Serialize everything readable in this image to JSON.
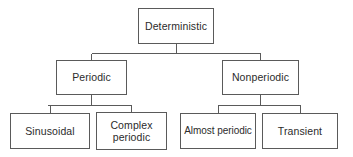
{
  "diagram": {
    "type": "tree",
    "style": {
      "background": "#ffffff",
      "border_color": "#5a5a5a",
      "text_color": "#2b2b2b",
      "node_fill": "#ffffff"
    },
    "nodes": [
      {
        "id": "deterministic",
        "label": "Deterministic",
        "level": 0,
        "x": 138,
        "y": 8,
        "w": 76,
        "h": 36
      },
      {
        "id": "periodic",
        "label": "Periodic",
        "level": 1,
        "x": 56,
        "y": 60,
        "w": 71,
        "h": 35
      },
      {
        "id": "nonperiodic",
        "label": "Nonperiodic",
        "level": 1,
        "x": 222,
        "y": 60,
        "w": 77,
        "h": 35
      },
      {
        "id": "sinusoidal",
        "label": "Sinusoidal",
        "level": 2,
        "x": 10,
        "y": 113,
        "w": 80,
        "h": 36
      },
      {
        "id": "complex-periodic",
        "label": "Complex\nperiodic",
        "level": 2,
        "x": 96,
        "y": 112,
        "w": 71,
        "h": 38
      },
      {
        "id": "almost-periodic",
        "label": "Almost periodic",
        "level": 2,
        "x": 180,
        "y": 113,
        "w": 76,
        "h": 36
      },
      {
        "id": "transient",
        "label": "Transient",
        "level": 2,
        "x": 262,
        "y": 113,
        "w": 76,
        "h": 36
      }
    ],
    "edges": [
      {
        "from": "deterministic",
        "to": "periodic"
      },
      {
        "from": "deterministic",
        "to": "nonperiodic"
      },
      {
        "from": "periodic",
        "to": "sinusoidal"
      },
      {
        "from": "periodic",
        "to": "complex-periodic"
      },
      {
        "from": "nonperiodic",
        "to": "almost-periodic"
      },
      {
        "from": "nonperiodic",
        "to": "transient"
      }
    ],
    "connector_geometry": {
      "bus_top": {
        "y": 53.5,
        "x_left": 91.5,
        "x_right": 260.5,
        "stem_x": 176
      },
      "bus_left": {
        "y": 105.5,
        "x_left": 47.5,
        "x_right": 131.5,
        "stem_x": 91.5
      },
      "bus_right": {
        "y": 105.5,
        "x_left": 217.5,
        "x_right": 300.5,
        "stem_x": 260.5
      }
    }
  }
}
